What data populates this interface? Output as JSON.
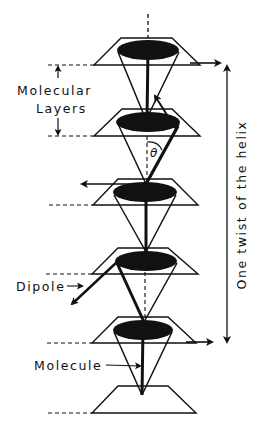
{
  "figure": {
    "type": "diagram",
    "labels": {
      "molecular_layers_line1": "Molecular",
      "molecular_layers_line2": "Layers",
      "dipole": "Dipole",
      "molecule": "Molecule",
      "tilt_angle": "θ",
      "helix_pitch": "One twist of the helix"
    },
    "colors": {
      "ink": "#111111",
      "background": "#ffffff"
    },
    "layers": [
      {
        "id": 1,
        "plane_top_y": 38,
        "plane_bottom_y": 65,
        "top_x": [
          121,
          172
        ],
        "bottom_x": [
          94,
          200
        ],
        "ellipse": {
          "cx": 148,
          "cy": 50,
          "rx": 31,
          "ry": 10
        },
        "cone_apex": [
          146,
          120
        ],
        "dipole_dir": "right"
      },
      {
        "id": 2,
        "plane_top_y": 109,
        "plane_bottom_y": 136,
        "top_x": [
          122,
          172
        ],
        "bottom_x": [
          94,
          200
        ],
        "ellipse": {
          "cx": 148,
          "cy": 122,
          "rx": 32,
          "ry": 10
        },
        "cone_apex": [
          146,
          184
        ],
        "dipole_dir": "up-left"
      },
      {
        "id": 3,
        "plane_top_y": 179,
        "plane_bottom_y": 205,
        "top_x": [
          118,
          172
        ],
        "bottom_x": [
          93,
          198
        ],
        "ellipse": {
          "cx": 145,
          "cy": 192,
          "rx": 32,
          "ry": 10
        },
        "cone_apex": [
          146,
          252
        ],
        "dipole_dir": "left"
      },
      {
        "id": 4,
        "plane_top_y": 248,
        "plane_bottom_y": 274,
        "top_x": [
          118,
          168
        ],
        "bottom_x": [
          92,
          198
        ],
        "ellipse": {
          "cx": 146,
          "cy": 261,
          "rx": 31,
          "ry": 10
        },
        "cone_apex": [
          144,
          322
        ],
        "dipole_dir": "down-left"
      },
      {
        "id": 5,
        "plane_top_y": 317,
        "plane_bottom_y": 343,
        "top_x": [
          118,
          168
        ],
        "bottom_x": [
          92,
          196
        ],
        "ellipse": {
          "cx": 143,
          "cy": 330,
          "rx": 30,
          "ry": 10
        },
        "cone_apex": [
          142,
          395
        ],
        "dipole_dir": "right"
      },
      {
        "id": 6,
        "plane_top_y": 386,
        "plane_bottom_y": 413,
        "top_x": [
          118,
          168
        ],
        "bottom_x": [
          92,
          196
        ]
      }
    ]
  }
}
